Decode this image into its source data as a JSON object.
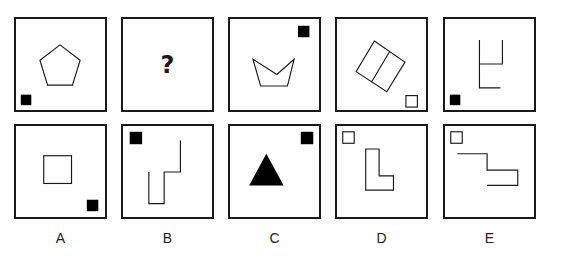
{
  "puzzle": {
    "question_row": [
      {
        "id": "q1",
        "shape": "pentagon-outline",
        "marker": "filled-square",
        "marker_position": "bottom-left"
      },
      {
        "id": "q2",
        "content": "?",
        "shape": "question-mark"
      },
      {
        "id": "q3",
        "shape": "crown-pentagon-outline",
        "marker": "filled-square",
        "marker_position": "top-right"
      },
      {
        "id": "q4",
        "shape": "rotated-divided-rectangle-outline",
        "marker": "hollow-square",
        "marker_position": "bottom-right"
      },
      {
        "id": "q5",
        "shape": "open-line-figure",
        "marker": "filled-square",
        "marker_position": "bottom-left"
      }
    ],
    "options": [
      {
        "label": "A",
        "shape": "square-outline",
        "marker": "filled-square",
        "marker_position": "bottom-right"
      },
      {
        "label": "B",
        "shape": "step-line-figure",
        "marker": "filled-square",
        "marker_position": "top-left"
      },
      {
        "label": "C",
        "shape": "filled-triangle",
        "marker": "filled-square",
        "marker_position": "top-right"
      },
      {
        "label": "D",
        "shape": "l-shape-outline",
        "marker": "hollow-square",
        "marker_position": "top-left"
      },
      {
        "label": "E",
        "shape": "z-line-figure",
        "marker": "hollow-square",
        "marker_position": "top-left"
      }
    ],
    "colors": {
      "stroke": "#1a1a1a",
      "fill": "#000000",
      "background": "#ffffff"
    }
  }
}
